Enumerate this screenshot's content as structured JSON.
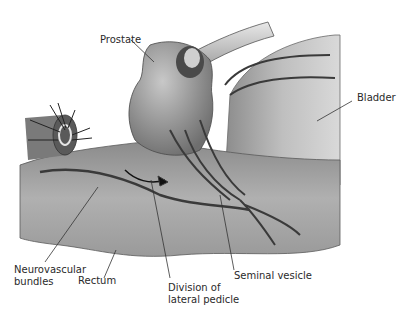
{
  "diagram": {
    "labels": {
      "prostate": "Prostate",
      "bladder": "Bladder",
      "neurovascular_bundles": "Neurovascular\nbundles",
      "rectum": "Rectum",
      "division_lateral_pedicle": "Division of\nlateral pedicle",
      "seminal_vesicle": "Seminal vesicle"
    },
    "colors": {
      "tissue_light": "#bdbdbd",
      "tissue_mid": "#9a9a9a",
      "tissue_dark": "#5a5a5a",
      "outline": "#3a3a3a"
    }
  }
}
